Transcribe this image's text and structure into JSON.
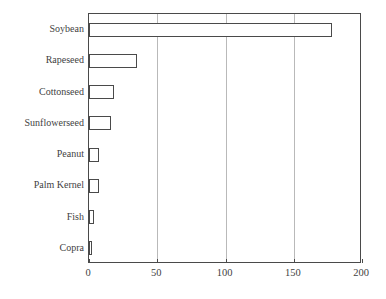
{
  "chart_data": {
    "type": "bar",
    "orientation": "horizontal",
    "title": "",
    "subtitle": "",
    "xlabel": "",
    "ylabel": "",
    "categories": [
      "Soybean",
      "Rapeseed",
      "Cottonseed",
      "Sunflowerseed",
      "Peanut",
      "Palm Kernel",
      "Fish",
      "Copra"
    ],
    "values": [
      178,
      35,
      18,
      16,
      7.5,
      7.5,
      3.5,
      2
    ],
    "series": [
      {
        "name": "",
        "values": [
          178,
          35,
          18,
          16,
          7.5,
          7.5,
          3.5,
          2
        ]
      }
    ],
    "xlim": [
      0,
      200
    ],
    "xticks": [
      0,
      50,
      100,
      150,
      200
    ],
    "xtick_labels": [
      "0",
      "50",
      "100",
      "150",
      "200"
    ],
    "grid": "vertical",
    "legend": "none",
    "bar_fill_color": "#ffffff",
    "bar_edge_color": "#4a4a4a",
    "gridline_color": "#b9b9b9",
    "axis_color": "#4a4a4a",
    "text_color": "#3f3f3f",
    "background_color": "#ffffff",
    "annotations": []
  }
}
